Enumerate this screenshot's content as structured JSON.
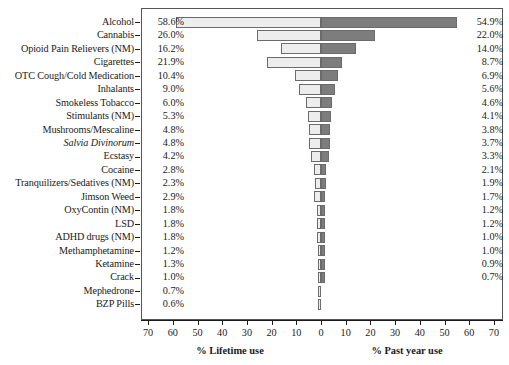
{
  "chart_data": {
    "type": "bar",
    "orientation": "horizontal",
    "style": "diverging-pyramid",
    "title": "",
    "categories": [
      "Alcohol",
      "Cannabis",
      "Opioid Pain Relievers (NM)",
      "Cigarettes",
      "OTC Cough/Cold Medication",
      "Inhalants",
      "Smokeless Tobacco",
      "Stimulants (NM)",
      "Mushrooms/Mescaline",
      "Salvia Divinorum",
      "Ecstasy",
      "Cocaine",
      "Tranquilizers/Sedatives (NM)",
      "Jimson Weed",
      "OxyContin (NM)",
      "LSD",
      "ADHD drugs (NM)",
      "Methamphetamine",
      "Ketamine",
      "Crack",
      "Mephedrone",
      "BZP Pills"
    ],
    "categories_italic": [
      "Salvia Divinorum"
    ],
    "series": [
      {
        "name": "% Lifetime use",
        "side": "left",
        "color": "#ededed",
        "values": [
          58.6,
          26.0,
          16.2,
          21.9,
          10.4,
          9.0,
          6.0,
          5.3,
          4.8,
          4.8,
          4.2,
          2.8,
          2.3,
          2.9,
          1.8,
          1.8,
          1.8,
          1.2,
          1.3,
          1.0,
          0.7,
          0.6
        ],
        "labels": [
          "58.6%",
          "26.0%",
          "16.2%",
          "21.9%",
          "10.4%",
          "9.0%",
          "6.0%",
          "5.3%",
          "4.8%",
          "4.8%",
          "4.2%",
          "2.8%",
          "2.3%",
          "2.9%",
          "1.8%",
          "1.8%",
          "1.8%",
          "1.2%",
          "1.3%",
          "1.0%",
          "0.7%",
          "0.6%"
        ]
      },
      {
        "name": "% Past year use",
        "side": "right",
        "color": "#7d7d7d",
        "values": [
          54.9,
          22.0,
          14.0,
          8.7,
          6.9,
          5.6,
          4.6,
          4.1,
          3.8,
          3.7,
          3.3,
          2.1,
          1.9,
          1.7,
          1.2,
          1.2,
          1.0,
          1.0,
          0.9,
          0.7,
          null,
          null
        ],
        "labels": [
          "54.9%",
          "22.0%",
          "14.0%",
          "8.7%",
          "6.9%",
          "5.6%",
          "4.6%",
          "4.1%",
          "3.8%",
          "3.7%",
          "3.3%",
          "2.1%",
          "1.9%",
          "1.7%",
          "1.2%",
          "1.2%",
          "1.0%",
          "1.0%",
          "0.9%",
          "0.7%",
          "",
          ""
        ]
      }
    ],
    "xlabel_left": "% Lifetime use",
    "xlabel_right": "% Past year use",
    "ylabel": "",
    "axis_ticks_left": [
      70,
      60,
      50,
      40,
      30,
      20,
      10,
      0
    ],
    "axis_ticks_right": [
      10,
      20,
      30,
      40,
      50,
      60,
      70
    ],
    "xlim": [
      70,
      70
    ],
    "grid": false,
    "legend": "none",
    "axis_color": "#1a1a1a",
    "frame_color": "#555555",
    "bar_border_color": "#6b6b6b"
  }
}
